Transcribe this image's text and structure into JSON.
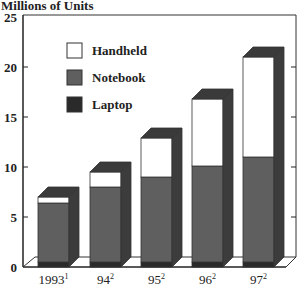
{
  "chart_data": {
    "type": "bar",
    "stacked": true,
    "style": "3d",
    "title": "",
    "ylabel": "Millions of Units",
    "xlabel": "",
    "categories": [
      "1993",
      "94",
      "95",
      "96",
      "97"
    ],
    "category_superscripts": [
      "1",
      "2",
      "2",
      "2",
      "2"
    ],
    "series": [
      {
        "name": "Laptop",
        "color": "#2a2a2a",
        "values": [
          0.5,
          0.5,
          0.5,
          0.5,
          0.5
        ]
      },
      {
        "name": "Notebook",
        "color": "#5f5f5f",
        "values": [
          5.9,
          7.5,
          8.5,
          9.6,
          10.5
        ]
      },
      {
        "name": "Handheld",
        "color": "#ffffff",
        "values": [
          0.6,
          1.5,
          3.9,
          6.7,
          10.0
        ]
      }
    ],
    "totals": [
      7.0,
      9.5,
      12.9,
      16.8,
      21.0
    ],
    "ylim": [
      0,
      25
    ],
    "yticks": [
      0,
      5,
      10,
      15,
      20,
      25
    ],
    "grid": false,
    "legend": {
      "position": "upper-left-inside",
      "order": [
        "Handheld",
        "Notebook",
        "Laptop"
      ]
    }
  }
}
